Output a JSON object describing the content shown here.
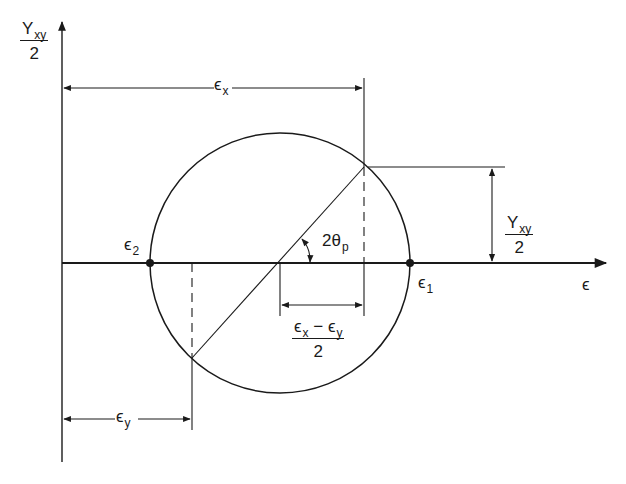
{
  "diagram": {
    "axes": {
      "vertical_label": {
        "symbol": "Y",
        "subscript": "xy",
        "denominator": "2"
      },
      "horizontal_label": "ϵ"
    },
    "points": {
      "e1": {
        "symbol": "ϵ",
        "subscript": "1"
      },
      "e2": {
        "symbol": "ϵ",
        "subscript": "2"
      }
    },
    "dimensions": {
      "ex": {
        "symbol": "ϵ",
        "subscript": "x"
      },
      "ey": {
        "symbol": "ϵ",
        "subscript": "y"
      },
      "half_gamma": {
        "symbol": "Y",
        "subscript": "xy",
        "denominator": "2"
      },
      "half_diff": {
        "a": "ϵ",
        "a_sub": "x",
        "op": " − ",
        "b": "ϵ",
        "b_sub": "y",
        "denominator": "2"
      }
    },
    "angle": {
      "label": "2θ",
      "subscript": "p"
    },
    "colors": {
      "ink": "#1a1a1a",
      "background": "#ffffff"
    }
  }
}
